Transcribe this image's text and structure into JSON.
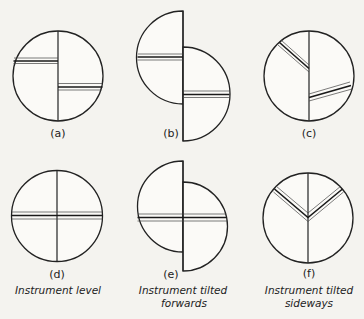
{
  "diagram": {
    "panels": [
      {
        "id": "a",
        "label": "(a)"
      },
      {
        "id": "b",
        "label": "(b)"
      },
      {
        "id": "c",
        "label": "(c)"
      },
      {
        "id": "d",
        "label": "(d)"
      },
      {
        "id": "e",
        "label": "(e)"
      },
      {
        "id": "f",
        "label": "(f)"
      }
    ],
    "captions": {
      "d": {
        "line1": "Instrument level",
        "line2": ""
      },
      "e": {
        "line1": "Instrument tilted",
        "line2": "forwards"
      },
      "f": {
        "line1": "Instrument tilted",
        "line2": "sideways"
      }
    },
    "colors": {
      "background": "#f4f3ef",
      "line": "#222222"
    }
  }
}
